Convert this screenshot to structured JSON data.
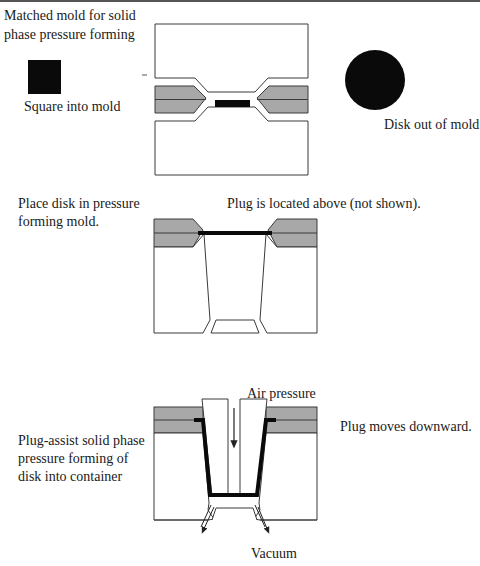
{
  "stage1": {
    "title_line1": "Matched mold for solid",
    "title_line2": "phase pressure forming",
    "square_label": "Square into mold",
    "disk_label": "Disk out of mold"
  },
  "stage2": {
    "title_line1": "Place disk in pressure",
    "title_line2": "forming mold.",
    "plug_note": "Plug is located above (not shown)."
  },
  "stage3": {
    "title_line1": "Plug-assist solid phase",
    "title_line2": "pressure forming of",
    "title_line3": "disk into container",
    "air_label": "Air pressure",
    "plug_motion": "Plug moves downward.",
    "vacuum_label": "Vacuum"
  },
  "colors": {
    "mold_gray": "#a8a8a8",
    "outline": "#3a3a3a",
    "material": "#0a0a0a",
    "background": "#ffffff"
  }
}
